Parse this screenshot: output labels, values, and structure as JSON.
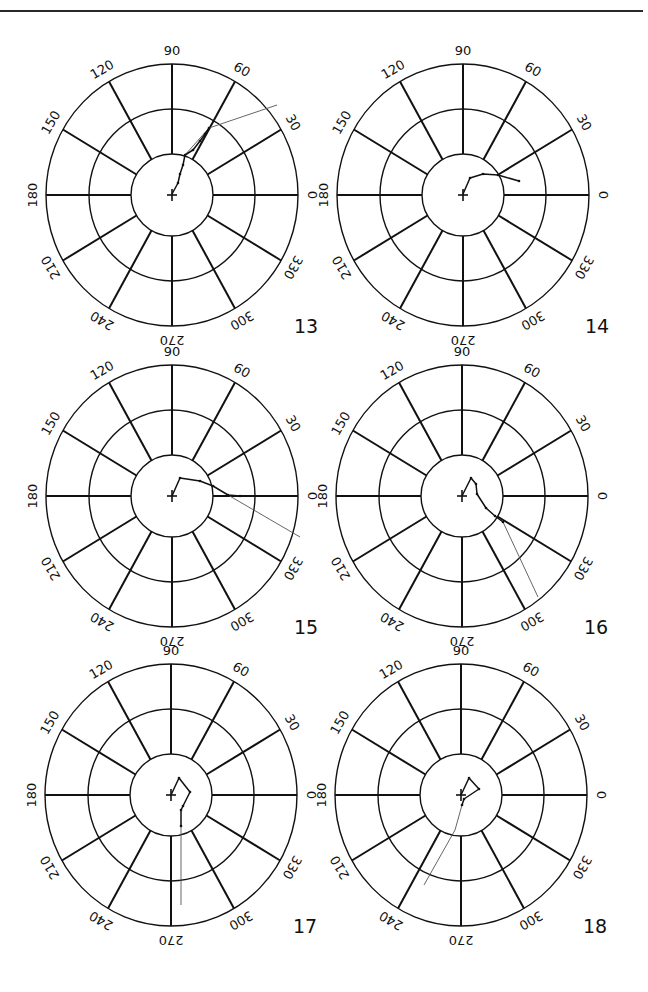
{
  "page": {
    "top_rule": true
  },
  "chart_data": [
    {
      "type": "polar_track",
      "id": "13",
      "label": "13",
      "center": [
        172,
        195
      ],
      "rings": [
        "inner",
        "middle",
        "outer"
      ],
      "angle_ticks": [
        "0",
        "30",
        "60",
        "90",
        "120",
        "150",
        "180",
        "210",
        "240",
        "270",
        "300",
        "330"
      ],
      "track_thick": [
        [
          172,
          194
        ],
        [
          178,
          183
        ],
        [
          180,
          174
        ],
        [
          183,
          165
        ],
        [
          185,
          155
        ],
        [
          193,
          150
        ],
        [
          200,
          141
        ],
        [
          205,
          134
        ],
        [
          209,
          128
        ]
      ],
      "track_thin": [
        [
          185,
          155
        ],
        [
          209,
          128
        ],
        [
          277,
          105
        ]
      ],
      "end_heading_deg": 20
    },
    {
      "type": "polar_track",
      "id": "14",
      "label": "14",
      "center": [
        463,
        195
      ],
      "rings": [
        "inner",
        "middle",
        "outer"
      ],
      "angle_ticks": [
        "0",
        "30",
        "60",
        "90",
        "120",
        "150",
        "180",
        "210",
        "240",
        "270",
        "300",
        "330"
      ],
      "track_thick": [
        [
          463,
          194
        ],
        [
          470,
          178
        ],
        [
          483,
          174
        ],
        [
          498,
          175
        ],
        [
          519,
          181
        ]
      ],
      "track_thin": [],
      "end_heading_deg": 15
    },
    {
      "type": "polar_track",
      "id": "15",
      "label": "15",
      "center": [
        172,
        496
      ],
      "rings": [
        "inner",
        "middle",
        "outer"
      ],
      "angle_ticks": [
        "0",
        "30",
        "60",
        "90",
        "120",
        "150",
        "180",
        "210",
        "240",
        "270",
        "300",
        "330"
      ],
      "track_thick": [
        [
          172,
          496
        ],
        [
          180,
          478
        ],
        [
          200,
          481
        ],
        [
          213,
          486
        ],
        [
          228,
          495
        ],
        [
          240,
          496
        ]
      ],
      "track_thin": [
        [
          228,
          495
        ],
        [
          300,
          537
        ]
      ],
      "end_heading_deg": 330
    },
    {
      "type": "polar_track",
      "id": "16",
      "label": "16",
      "center": [
        462,
        496
      ],
      "rings": [
        "inner",
        "middle",
        "outer"
      ],
      "angle_ticks": [
        "0",
        "30",
        "60",
        "90",
        "120",
        "150",
        "180",
        "210",
        "240",
        "270",
        "300",
        "330"
      ],
      "track_thick": [
        [
          462,
          496
        ],
        [
          471,
          478
        ],
        [
          476,
          484
        ],
        [
          477,
          494
        ],
        [
          486,
          508
        ],
        [
          495,
          516
        ],
        [
          503,
          522
        ]
      ],
      "track_thin": [
        [
          503,
          522
        ],
        [
          538,
          597
        ]
      ],
      "end_heading_deg": 300
    },
    {
      "type": "polar_track",
      "id": "17",
      "label": "17",
      "center": [
        171,
        795
      ],
      "rings": [
        "inner",
        "middle",
        "outer"
      ],
      "angle_ticks": [
        "0",
        "30",
        "60",
        "90",
        "120",
        "150",
        "180",
        "210",
        "240",
        "270",
        "300",
        "330"
      ],
      "track_thick": [
        [
          171,
          795
        ],
        [
          179,
          778
        ],
        [
          190,
          792
        ],
        [
          183,
          806
        ],
        [
          181,
          810
        ],
        [
          181,
          826
        ]
      ],
      "track_thin": [
        [
          181,
          826
        ],
        [
          181,
          905
        ]
      ],
      "end_heading_deg": 272
    },
    {
      "type": "polar_track",
      "id": "18",
      "label": "18",
      "center": [
        461,
        795
      ],
      "rings": [
        "inner",
        "middle",
        "outer"
      ],
      "angle_ticks": [
        "0",
        "30",
        "60",
        "90",
        "120",
        "150",
        "180",
        "210",
        "240",
        "270",
        "300",
        "330"
      ],
      "track_thick": [
        [
          461,
          795
        ],
        [
          469,
          778
        ],
        [
          479,
          789
        ],
        [
          464,
          799
        ],
        [
          462,
          805
        ]
      ],
      "track_thin": [
        [
          462,
          805
        ],
        [
          455,
          830
        ],
        [
          424,
          885
        ]
      ],
      "end_heading_deg": 245
    }
  ],
  "plots": [
    {
      "label": "13"
    },
    {
      "label": "14"
    },
    {
      "label": "15"
    },
    {
      "label": "16"
    },
    {
      "label": "17"
    },
    {
      "label": "18"
    }
  ],
  "geometry": {
    "r_outer_x": 126,
    "r_outer_y": 131,
    "r_middle_x": 83,
    "r_middle_y": 86,
    "r_inner_x": 41,
    "r_inner_y": 41,
    "label_offset": 14,
    "number_offset": [
      122,
      138
    ],
    "colors": {
      "ink": "#111111",
      "thin_track": "#555555",
      "background": "#ffffff"
    }
  }
}
